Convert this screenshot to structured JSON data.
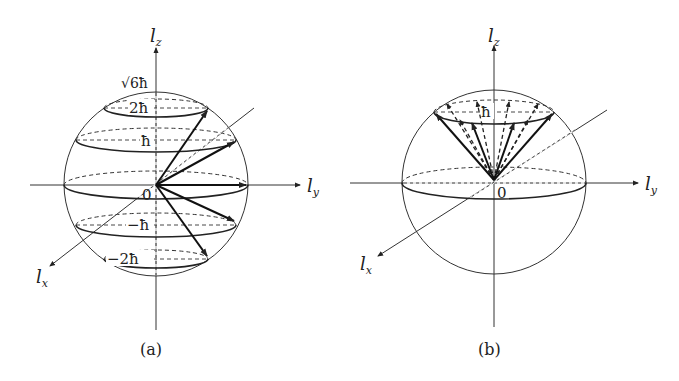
{
  "figures": [
    {
      "id": "a",
      "caption": "(a)",
      "axes": {
        "x": "l",
        "x_sub": "x",
        "y": "l",
        "y_sub": "y",
        "z": "l",
        "z_sub": "z"
      },
      "radius_label": "√6ħ",
      "origin_label": "0",
      "level_labels": [
        "2ħ",
        "ħ",
        "0",
        "−ħ",
        "−2ħ"
      ],
      "description": "Vector model for l=2: angular momentum vectors of length √6ħ with z-projections 2ħ, ħ, 0, −ħ, −2ħ"
    },
    {
      "id": "b",
      "caption": "(b)",
      "axes": {
        "x": "l",
        "x_sub": "x",
        "y": "l",
        "y_sub": "y",
        "z": "l",
        "z_sub": "z"
      },
      "origin_label": "0",
      "level_labels": [
        "ħ"
      ],
      "description": "Precession cone: many angular momentum vectors with fixed z-projection ħ distributed on a cone"
    }
  ]
}
